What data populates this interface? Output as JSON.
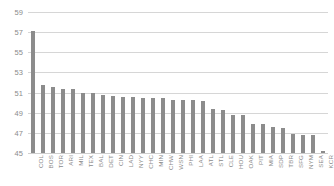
{
  "chart_data": {
    "type": "bar",
    "title": "",
    "xlabel": "",
    "ylabel": "",
    "ylim": [
      45,
      59
    ],
    "ytick_step": 2,
    "yticks": [
      59,
      57,
      55,
      53,
      51,
      49,
      47,
      45
    ],
    "grid": true,
    "legend": false,
    "bar_color": "#8c8c8c",
    "gridline_color": "#d6d6d6",
    "tick_label_color": "#8c8c8c",
    "categories": [
      "COL",
      "BOS",
      "TOR",
      "ARI",
      "MIL",
      "TEX",
      "BAL",
      "DET",
      "CIN",
      "LAD",
      "NYY",
      "CHC",
      "MIN",
      "CHW",
      "WSN",
      "PHI",
      "LAA",
      "ATL",
      "STL",
      "CLE",
      "HOU",
      "OAK",
      "PIT",
      "MIA",
      "SDP",
      "TBR",
      "SFG",
      "NYM",
      "SEA",
      "KCR"
    ],
    "values": [
      57.1,
      51.8,
      51.6,
      51.4,
      51.4,
      51.0,
      51.0,
      50.8,
      50.7,
      50.6,
      50.6,
      50.5,
      50.5,
      50.5,
      50.3,
      50.3,
      50.3,
      50.2,
      49.4,
      49.3,
      48.8,
      48.8,
      47.9,
      47.9,
      47.6,
      47.5,
      46.9,
      46.8,
      46.8,
      45.2
    ],
    "series": [
      {
        "name": "Value",
        "values": [
          57.1,
          51.8,
          51.6,
          51.4,
          51.4,
          51.0,
          51.0,
          50.8,
          50.7,
          50.6,
          50.6,
          50.5,
          50.5,
          50.5,
          50.3,
          50.3,
          50.3,
          50.2,
          49.4,
          49.3,
          48.8,
          48.8,
          47.9,
          47.9,
          47.6,
          47.5,
          46.9,
          46.8,
          46.8,
          45.2
        ]
      }
    ]
  }
}
